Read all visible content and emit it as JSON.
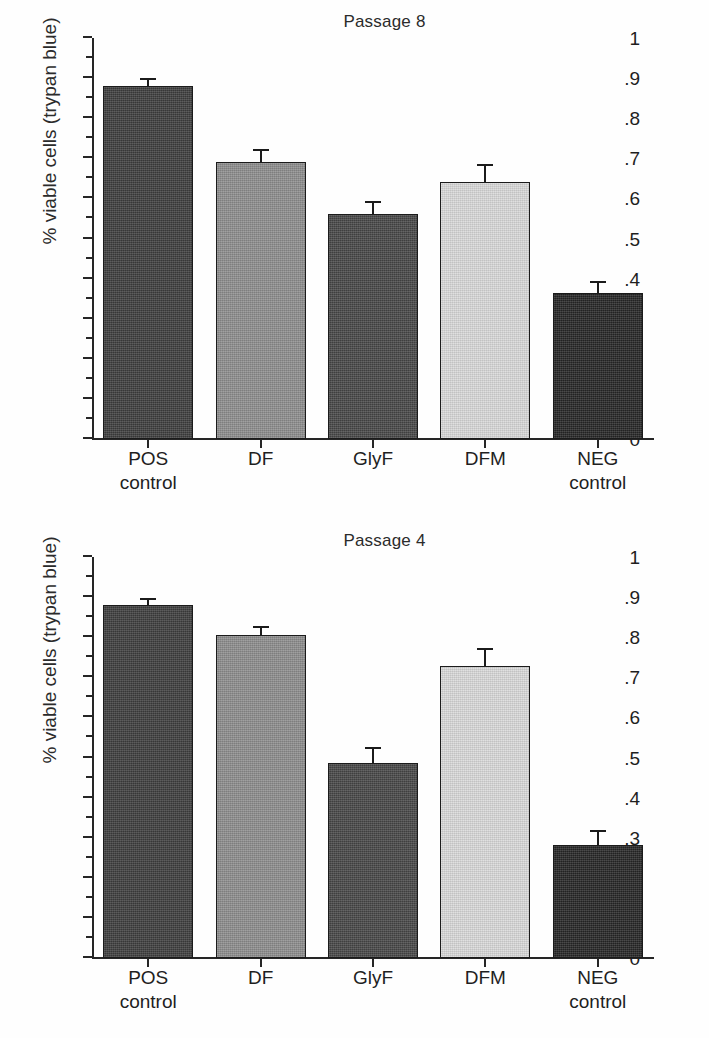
{
  "figure": {
    "ylabel": "% viable cells (trypan blue)",
    "ytick_labels": [
      "0",
      ".1",
      ".2",
      ".3",
      ".4",
      ".5",
      ".6",
      ".7",
      ".8",
      ".9",
      "1"
    ],
    "categories": [
      "POS control",
      "DF",
      "GlyF",
      "DFM",
      "NEG control"
    ],
    "category_lines": [
      {
        "l1": "POS",
        "l2": "control"
      },
      {
        "l1": "DF",
        "l2": ""
      },
      {
        "l1": "GlyF",
        "l2": ""
      },
      {
        "l1": "DFM",
        "l2": ""
      },
      {
        "l1": "NEG",
        "l2": "control"
      }
    ],
    "bar_colors": [
      "#3d3d3d",
      "#8d8d8d",
      "#474747",
      "#d9d9d9",
      "#262626"
    ]
  },
  "chart_data": [
    {
      "type": "bar",
      "title": "Passage 8",
      "xlabel": "",
      "ylabel": "% viable cells (trypan blue)",
      "ylim": [
        0,
        1
      ],
      "ytick_values": [
        0,
        0.1,
        0.2,
        0.3,
        0.4,
        0.5,
        0.6,
        0.7,
        0.8,
        0.9,
        1
      ],
      "grid": false,
      "legend": "none",
      "categories": [
        "POS control",
        "DF",
        "GlyF",
        "DFM",
        "NEG control"
      ],
      "values": [
        0.88,
        0.69,
        0.56,
        0.64,
        0.365
      ],
      "errors": [
        0.015,
        0.028,
        0.028,
        0.04,
        0.025
      ],
      "colors": [
        "#3d3d3d",
        "#8d8d8d",
        "#474747",
        "#d9d9d9",
        "#262626"
      ]
    },
    {
      "type": "bar",
      "title": "Passage 4",
      "xlabel": "",
      "ylabel": "% viable cells (trypan blue)",
      "ylim": [
        0,
        1
      ],
      "ytick_values": [
        0,
        0.1,
        0.2,
        0.3,
        0.4,
        0.5,
        0.6,
        0.7,
        0.8,
        0.9,
        1
      ],
      "grid": false,
      "legend": "none",
      "categories": [
        "POS control",
        "DF",
        "GlyF",
        "DFM",
        "NEG control"
      ],
      "values": [
        0.88,
        0.805,
        0.487,
        0.727,
        0.283
      ],
      "errors": [
        0.012,
        0.018,
        0.035,
        0.04,
        0.032
      ],
      "colors": [
        "#3d3d3d",
        "#8d8d8d",
        "#474747",
        "#d9d9d9",
        "#262626"
      ]
    }
  ]
}
